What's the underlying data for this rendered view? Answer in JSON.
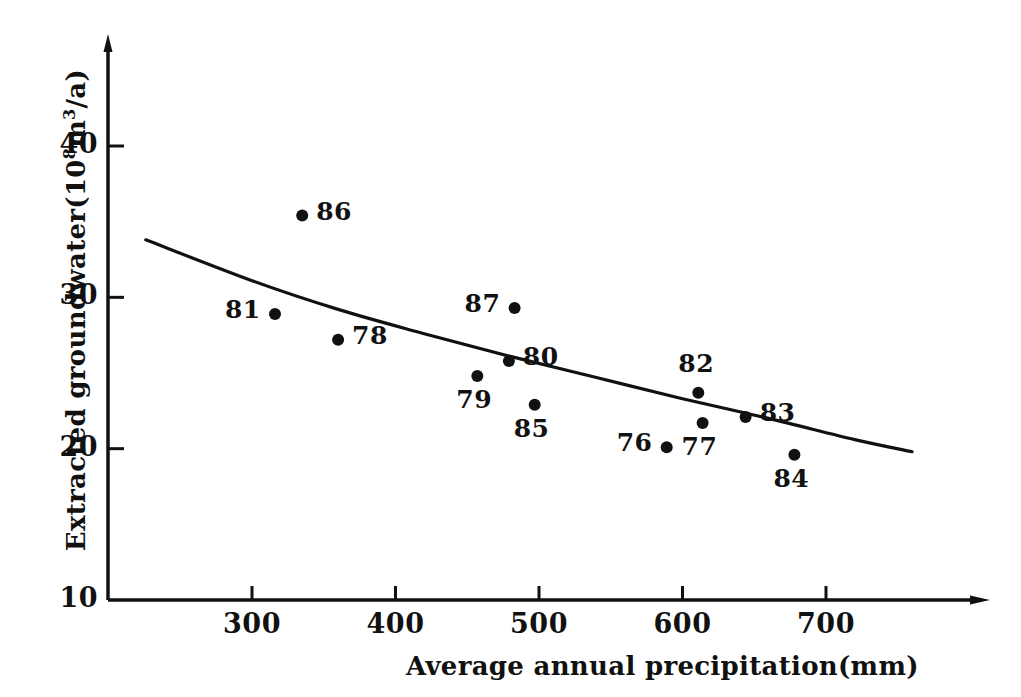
{
  "chart_data": {
    "type": "scatter",
    "title": "",
    "xlabel": "Average annual precipitation(mm)",
    "ylabel_prefix": "Extracted groundwater(10",
    "ylabel_sup1": "8",
    "ylabel_mid": "m",
    "ylabel_sup2": "3",
    "ylabel_suffix": "/a)",
    "ylabel_plain": "Extracted groundwater(10^8 m^3/a)",
    "xlim": [
      215,
      800
    ],
    "ylim": [
      10,
      46
    ],
    "xticks": [
      300,
      400,
      500,
      600,
      700
    ],
    "yticks": [
      10,
      20,
      30,
      40
    ],
    "xtick_labels": [
      "300",
      "400",
      "500",
      "600",
      "700"
    ],
    "ytick_labels": [
      "10",
      "20",
      "30",
      "40"
    ],
    "grid": false,
    "legend": "none",
    "point_color": "#111111",
    "axis_color": "#111111",
    "points": [
      {
        "label": "86",
        "x": 335,
        "y": 35.4,
        "label_pos": "right"
      },
      {
        "label": "81",
        "x": 316,
        "y": 28.9,
        "label_pos": "left"
      },
      {
        "label": "78",
        "x": 360,
        "y": 27.2,
        "label_pos": "right"
      },
      {
        "label": "87",
        "x": 483,
        "y": 29.3,
        "label_pos": "left"
      },
      {
        "label": "80",
        "x": 479,
        "y": 25.8,
        "label_pos": "right"
      },
      {
        "label": "79",
        "x": 457,
        "y": 24.8,
        "label_pos": "below"
      },
      {
        "label": "85",
        "x": 497,
        "y": 22.9,
        "label_pos": "below"
      },
      {
        "label": "82",
        "x": 611,
        "y": 23.7,
        "label_pos": "above"
      },
      {
        "label": "83",
        "x": 644,
        "y": 22.1,
        "label_pos": "right"
      },
      {
        "label": "77",
        "x": 614,
        "y": 21.7,
        "label_pos": "below"
      },
      {
        "label": "76",
        "x": 589,
        "y": 20.1,
        "label_pos": "left"
      },
      {
        "label": "84",
        "x": 678,
        "y": 19.6,
        "label_pos": "below"
      }
    ],
    "trend_curve": {
      "description": "decreasing fitted curve",
      "points": [
        {
          "x": 226,
          "y": 33.8
        },
        {
          "x": 300,
          "y": 31.1
        },
        {
          "x": 360,
          "y": 29.2
        },
        {
          "x": 420,
          "y": 27.6
        },
        {
          "x": 480,
          "y": 26.1
        },
        {
          "x": 540,
          "y": 24.7
        },
        {
          "x": 600,
          "y": 23.3
        },
        {
          "x": 660,
          "y": 22.0
        },
        {
          "x": 720,
          "y": 20.6
        },
        {
          "x": 760,
          "y": 19.8
        }
      ]
    }
  }
}
